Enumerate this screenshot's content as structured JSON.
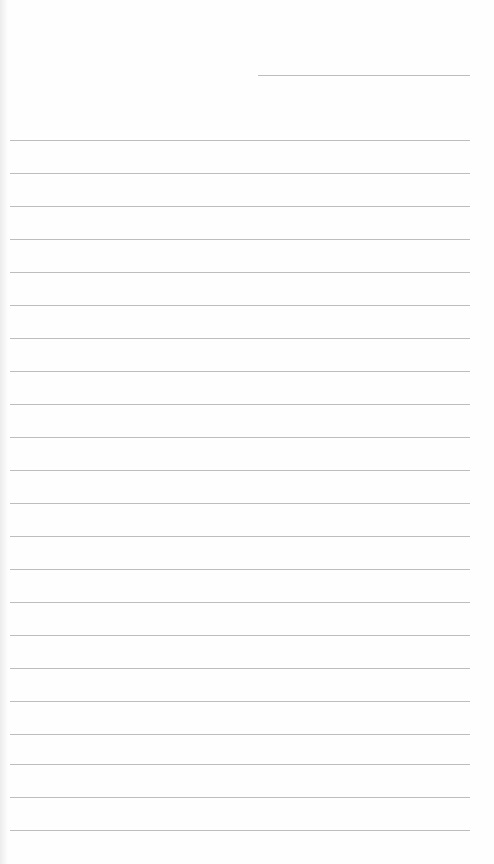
{
  "document": {
    "type": "blank lined paper",
    "line_color": "#bdbdbd",
    "background_color": "#fefefe",
    "header_line": {
      "x1": 258,
      "x2": 470,
      "y": 75
    },
    "ruled_lines": {
      "x1": 10,
      "x2": 470,
      "y_positions": [
        140,
        173,
        206,
        239,
        272,
        305,
        338,
        371,
        404,
        437,
        470,
        503,
        536,
        569,
        602,
        635,
        668,
        701,
        734,
        764,
        797,
        830
      ]
    }
  }
}
